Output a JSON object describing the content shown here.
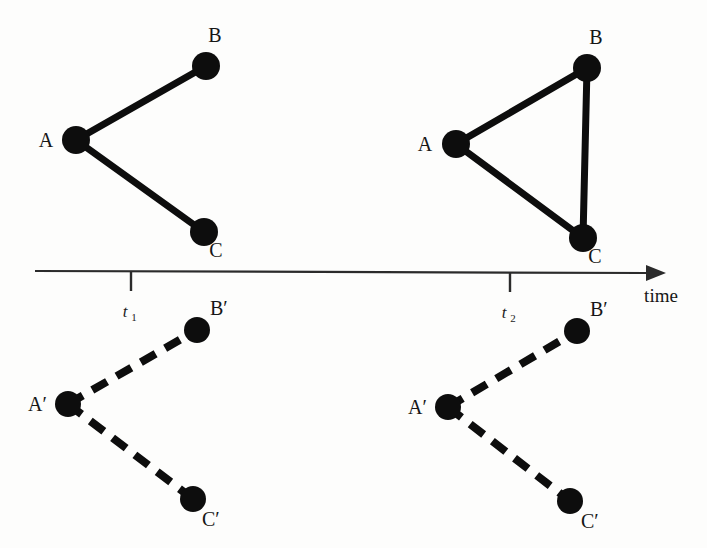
{
  "figure": {
    "background_color": "#fdfdfc",
    "ink_color": "#0d0d0d",
    "description_type": "temporal-graph-snapshots"
  },
  "axis": {
    "title": "time",
    "line": {
      "x1": 35,
      "y1": 272,
      "x2": 646,
      "y2": 272
    },
    "arrow_tip_x": 660,
    "ticks": [
      {
        "id": "t1",
        "base": "t",
        "subscript": "1",
        "x": 131
      },
      {
        "id": "t2",
        "base": "t",
        "subscript": "2",
        "x": 510
      }
    ]
  },
  "panels": [
    {
      "id": "upper-left",
      "row": "upper",
      "time": "t1",
      "line_style": "solid",
      "nodes": [
        {
          "id": "A",
          "label": "A",
          "prime": false,
          "x": 76,
          "y": 140,
          "r": 14,
          "label_x": 46,
          "label_y": 147
        },
        {
          "id": "B",
          "label": "B",
          "prime": false,
          "x": 206,
          "y": 66,
          "r": 14,
          "label_x": 215,
          "label_y": 42
        },
        {
          "id": "C",
          "label": "C",
          "prime": false,
          "x": 204,
          "y": 232,
          "r": 14,
          "label_x": 216,
          "label_y": 257
        }
      ],
      "edges": [
        {
          "from": "A",
          "to": "B"
        },
        {
          "from": "A",
          "to": "C"
        }
      ]
    },
    {
      "id": "upper-right",
      "row": "upper",
      "time": "t2",
      "line_style": "solid",
      "nodes": [
        {
          "id": "A",
          "label": "A",
          "prime": false,
          "x": 456,
          "y": 144,
          "r": 14,
          "label_x": 425,
          "label_y": 151
        },
        {
          "id": "B",
          "label": "B",
          "prime": false,
          "x": 587,
          "y": 68,
          "r": 14,
          "label_x": 596,
          "label_y": 44
        },
        {
          "id": "C",
          "label": "C",
          "prime": false,
          "x": 583,
          "y": 238,
          "r": 14,
          "label_x": 595,
          "label_y": 263
        }
      ],
      "edges": [
        {
          "from": "A",
          "to": "B"
        },
        {
          "from": "A",
          "to": "C"
        },
        {
          "from": "B",
          "to": "C"
        }
      ]
    },
    {
      "id": "lower-left",
      "row": "lower",
      "time": "t1",
      "line_style": "dashed",
      "nodes": [
        {
          "id": "Ap",
          "label": "A",
          "prime": true,
          "x": 68,
          "y": 404,
          "r": 13,
          "label_x": 28,
          "label_y": 411
        },
        {
          "id": "Bp",
          "label": "B",
          "prime": true,
          "x": 197,
          "y": 330,
          "r": 13,
          "label_x": 210,
          "label_y": 315
        },
        {
          "id": "Cp",
          "label": "C",
          "prime": true,
          "x": 193,
          "y": 499,
          "r": 13,
          "label_x": 202,
          "label_y": 526
        }
      ],
      "edges": [
        {
          "from": "Ap",
          "to": "Bp"
        },
        {
          "from": "Ap",
          "to": "Cp"
        }
      ]
    },
    {
      "id": "lower-right",
      "row": "lower",
      "time": "t2",
      "line_style": "dashed",
      "nodes": [
        {
          "id": "Ap",
          "label": "A",
          "prime": true,
          "x": 448,
          "y": 407,
          "r": 13,
          "label_x": 408,
          "label_y": 414
        },
        {
          "id": "Bp",
          "label": "B",
          "prime": true,
          "x": 577,
          "y": 331,
          "r": 13,
          "label_x": 590,
          "label_y": 316
        },
        {
          "id": "Cp",
          "label": "C",
          "prime": true,
          "x": 570,
          "y": 501,
          "r": 13,
          "label_x": 581,
          "label_y": 528
        }
      ],
      "edges": [
        {
          "from": "Ap",
          "to": "Bp"
        },
        {
          "from": "Ap",
          "to": "Cp"
        }
      ]
    }
  ],
  "labels": {
    "A": "A",
    "B": "B",
    "C": "C",
    "prime": "′",
    "time": "time",
    "t": "t",
    "one": "1",
    "two": "2"
  }
}
